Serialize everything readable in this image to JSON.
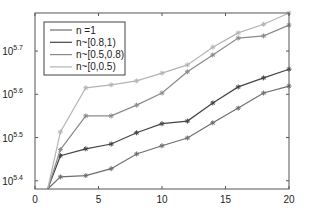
{
  "chart_data": {
    "type": "line",
    "title": "",
    "xlabel": "",
    "ylabel": "",
    "yscale": "log",
    "xlim": [
      0,
      20
    ],
    "ylim_log10": [
      5.381,
      5.788
    ],
    "grid": false,
    "legend_position": "upper-left",
    "x": [
      1,
      2,
      4,
      6,
      8,
      10,
      12,
      14,
      16,
      18,
      20
    ],
    "x_ticks": [
      0,
      5,
      10,
      15,
      20
    ],
    "x_tick_labels": [
      "0",
      "5",
      "10",
      "15",
      "20"
    ],
    "y_ticks_log10": [
      5.4,
      5.5,
      5.6,
      5.7
    ],
    "y_tick_labels": [
      {
        "base": "10",
        "exp": "5.4"
      },
      {
        "base": "10",
        "exp": "5.5"
      },
      {
        "base": "10",
        "exp": "5.6"
      },
      {
        "base": "10",
        "exp": "5.7"
      }
    ],
    "series": [
      {
        "name": "n =1",
        "color": "#6e6e6e",
        "marker": "*",
        "values_log10": [
          5.381,
          5.409,
          5.412,
          5.428,
          5.462,
          5.481,
          5.499,
          5.534,
          5.568,
          5.603,
          5.619
        ]
      },
      {
        "name": "n~[0.8,1)",
        "color": "#444444",
        "marker": "*",
        "values_log10": [
          5.381,
          5.458,
          5.474,
          5.485,
          5.511,
          5.532,
          5.538,
          5.58,
          5.617,
          5.638,
          5.658
        ]
      },
      {
        "name": "n~[0.5,0.8)",
        "color": "#8a8a8a",
        "marker": "*",
        "values_log10": [
          5.381,
          5.472,
          5.55,
          5.55,
          5.575,
          5.603,
          5.652,
          5.691,
          5.73,
          5.735,
          5.76
        ]
      },
      {
        "name": "n~[0,0.5)",
        "color": "#b4b4b4",
        "marker": "*",
        "values_log10": [
          5.381,
          5.513,
          5.615,
          5.622,
          5.631,
          5.649,
          5.668,
          5.709,
          5.742,
          5.762,
          5.788
        ]
      }
    ]
  },
  "layout": {
    "plot": {
      "left": 35,
      "right": 289,
      "top": 13,
      "bottom": 189
    },
    "legend": {
      "x": 44,
      "y": 22,
      "width": 81,
      "height": 53
    }
  }
}
